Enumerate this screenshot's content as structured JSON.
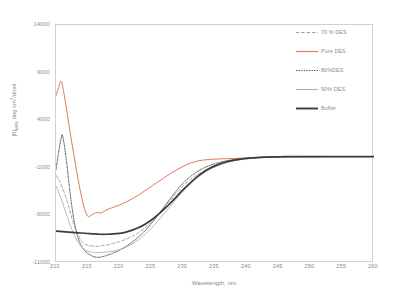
{
  "chart_data": {
    "type": "line",
    "title": "",
    "xlabel": "Wavelength, nm",
    "ylabel": "[θ]MRE deg cm2/dmol",
    "ylabel_parts": {
      "prefix": "[θ]",
      "sub": "MRE",
      "mid": " deg cm",
      "sup": "2",
      "suffix": "/dmol"
    },
    "xlim": [
      210,
      260
    ],
    "ylim": [
      -11000,
      14000
    ],
    "xticks": [
      210,
      215,
      220,
      225,
      230,
      235,
      240,
      245,
      250,
      255,
      260
    ],
    "yticks": [
      14000,
      9000,
      4000,
      -1000,
      -6000,
      -11000
    ],
    "grid": false,
    "legend_position": "inside-top-right",
    "series": [
      {
        "name": "70 % DES",
        "color": "#9a9a9a",
        "style": "dashed",
        "width": 0.9,
        "x": [
          210,
          210.5,
          211,
          211.5,
          212,
          212.5,
          213,
          213.5,
          214,
          214.5,
          215,
          216,
          217,
          218,
          219,
          220,
          221,
          222,
          223,
          224,
          225,
          226,
          227,
          228,
          229,
          230,
          231,
          232,
          233,
          234,
          235,
          236,
          237,
          238,
          239,
          240,
          241,
          242,
          243,
          244,
          245,
          246,
          248,
          250,
          252,
          254,
          256,
          258,
          260
        ],
        "y": [
          -1800,
          -2300,
          -3100,
          -4000,
          -5100,
          -6300,
          -7300,
          -8100,
          -8700,
          -9000,
          -9150,
          -9250,
          -9200,
          -9100,
          -8950,
          -8750,
          -8500,
          -8200,
          -7800,
          -7300,
          -6700,
          -6000,
          -5200,
          -4400,
          -3600,
          -2900,
          -2300,
          -1800,
          -1400,
          -1050,
          -750,
          -520,
          -340,
          -200,
          -100,
          -20,
          40,
          80,
          110,
          130,
          145,
          155,
          165,
          170,
          172,
          174,
          175,
          176,
          177
        ]
      },
      {
        "name": "Pure DES",
        "color": "#e2775c",
        "style": "solid",
        "width": 1.0,
        "x": [
          210,
          210.4,
          210.8,
          211.2,
          211.6,
          212,
          212.5,
          213,
          213.5,
          214,
          214.5,
          215,
          215.5,
          216,
          216.5,
          217,
          217.5,
          218,
          219,
          220,
          221,
          222,
          223,
          224,
          225,
          226,
          227,
          228,
          229,
          230,
          231,
          232,
          233,
          234,
          235,
          236,
          237,
          238,
          239,
          240,
          241,
          242,
          243,
          244,
          245,
          246,
          248,
          250,
          252,
          254,
          256,
          258,
          260
        ],
        "y": [
          6600,
          7400,
          8100,
          7000,
          5400,
          3700,
          1600,
          -400,
          -2300,
          -4000,
          -5300,
          -6100,
          -6000,
          -5800,
          -5700,
          -5750,
          -5600,
          -5400,
          -5150,
          -4900,
          -4600,
          -4250,
          -3850,
          -3400,
          -2950,
          -2500,
          -2050,
          -1600,
          -1200,
          -850,
          -550,
          -330,
          -200,
          -130,
          -90,
          -60,
          -40,
          -20,
          0,
          20,
          45,
          70,
          95,
          115,
          130,
          140,
          155,
          165,
          170,
          173,
          175,
          176,
          177
        ]
      },
      {
        "name": "80%DES",
        "color": "#4a4a4a",
        "style": "dotted",
        "width": 0.9,
        "x": [
          210,
          210.4,
          210.8,
          211,
          211.3,
          211.7,
          212,
          212.5,
          213,
          213.5,
          214,
          214.5,
          215,
          215.5,
          216,
          216.5,
          217,
          218,
          219,
          220,
          221,
          222,
          223,
          224,
          225,
          226,
          227,
          228,
          229,
          230,
          231,
          232,
          233,
          234,
          235,
          236,
          237,
          238,
          239,
          240,
          241,
          242,
          243,
          244,
          245,
          246,
          248,
          250,
          252,
          254,
          256,
          258,
          260
        ],
        "y": [
          -1200,
          600,
          2050,
          2450,
          1400,
          -600,
          -2400,
          -5100,
          -7100,
          -8400,
          -9200,
          -9700,
          -10000,
          -10200,
          -10350,
          -10400,
          -10380,
          -10200,
          -9950,
          -9650,
          -9250,
          -8800,
          -8250,
          -7600,
          -6850,
          -6000,
          -5100,
          -4200,
          -3350,
          -2600,
          -2000,
          -1500,
          -1100,
          -800,
          -560,
          -380,
          -240,
          -140,
          -60,
          0,
          50,
          90,
          120,
          142,
          158,
          166,
          172,
          175,
          176,
          177,
          177,
          178,
          178
        ]
      },
      {
        "name": "90% DES",
        "color": "#9fb6cc",
        "style": "solid",
        "width": 0.9,
        "x": [
          210,
          210.5,
          211,
          211.5,
          212,
          212.5,
          213,
          213.5,
          214,
          214.5,
          215,
          215.5,
          216,
          217,
          218,
          219,
          220,
          221,
          222,
          223,
          224,
          225,
          226,
          227,
          228,
          229,
          230,
          231,
          232,
          233,
          234,
          235,
          236,
          237,
          238,
          239,
          240,
          241,
          242,
          243,
          244,
          245,
          246,
          248,
          250,
          252,
          254,
          256,
          258,
          260
        ],
        "y": [
          -2900,
          -3700,
          -4600,
          -5600,
          -6600,
          -7500,
          -8250,
          -8850,
          -9300,
          -9600,
          -9750,
          -9850,
          -9900,
          -9900,
          -9850,
          -9750,
          -9600,
          -9350,
          -9000,
          -8550,
          -8000,
          -7350,
          -6600,
          -5800,
          -5000,
          -4200,
          -3450,
          -2750,
          -2150,
          -1650,
          -1230,
          -900,
          -640,
          -440,
          -280,
          -160,
          -70,
          0,
          55,
          95,
          125,
          145,
          158,
          170,
          174,
          176,
          177,
          177,
          178,
          178
        ]
      },
      {
        "name": "Buffer",
        "color": "#3c3c3c",
        "style": "solid",
        "width": 1.7,
        "x": [
          210,
          211,
          212,
          213,
          214,
          215,
          216,
          217,
          218,
          219,
          220,
          221,
          222,
          223,
          224,
          225,
          226,
          227,
          228,
          229,
          230,
          231,
          232,
          233,
          234,
          235,
          236,
          237,
          238,
          239,
          240,
          241,
          242,
          243,
          244,
          245,
          246,
          248,
          250,
          252,
          254,
          256,
          258,
          260
        ],
        "y": [
          -7650,
          -7700,
          -7750,
          -7800,
          -7850,
          -7900,
          -7950,
          -7980,
          -7980,
          -7950,
          -7880,
          -7750,
          -7550,
          -7280,
          -6920,
          -6480,
          -5950,
          -5350,
          -4700,
          -4000,
          -3300,
          -2650,
          -2050,
          -1550,
          -1130,
          -800,
          -540,
          -340,
          -190,
          -80,
          0,
          50,
          90,
          120,
          142,
          156,
          165,
          172,
          175,
          176,
          177,
          177,
          178,
          178
        ]
      }
    ]
  },
  "axes": {
    "ytick_labels": [
      "14000",
      "9000",
      "4000",
      "-1000",
      "-6000",
      "-11000"
    ],
    "xtick_labels": [
      "210",
      "215",
      "220",
      "225",
      "230",
      "235",
      "240",
      "245",
      "250",
      "255",
      "260"
    ]
  },
  "legend": {
    "items": [
      {
        "label": "70 % DES"
      },
      {
        "label": "Pure DES"
      },
      {
        "label": "80%DES"
      },
      {
        "label": "90% DES"
      },
      {
        "label": "Buffer"
      }
    ]
  }
}
